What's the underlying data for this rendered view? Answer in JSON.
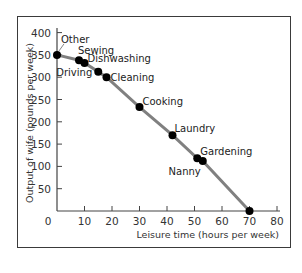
{
  "chart_data": {
    "type": "line",
    "title": "",
    "xlabel": "Leisure time (hours per week)",
    "ylabel": "Output of wife (pounds per week)",
    "xlim": [
      0,
      80
    ],
    "ylim": [
      0,
      400
    ],
    "x_ticks": [
      "0",
      "10",
      "20",
      "30",
      "40",
      "50",
      "60",
      "70",
      "80"
    ],
    "y_ticks": [
      "50",
      "100",
      "150",
      "200",
      "250",
      "300",
      "350",
      "400"
    ],
    "grid": false,
    "legend": null,
    "line_color": "#808080",
    "marker_color": "#000000",
    "series": [
      {
        "name": "Production possibilities",
        "points": [
          {
            "label": "Other",
            "x": 0,
            "y": 350
          },
          {
            "label": "Sewing",
            "x": 8,
            "y": 338
          },
          {
            "label": "Dishwashing",
            "x": 10,
            "y": 332
          },
          {
            "label": "Driving",
            "x": 15,
            "y": 312
          },
          {
            "label": "Cleaning",
            "x": 18,
            "y": 300
          },
          {
            "label": "Cooking",
            "x": 30,
            "y": 233
          },
          {
            "label": "Laundry",
            "x": 42,
            "y": 170
          },
          {
            "label": "Gardening",
            "x": 51,
            "y": 118
          },
          {
            "label": "Nanny",
            "x": 53,
            "y": 112
          },
          {
            "label": "",
            "x": 70,
            "y": 0
          }
        ]
      }
    ]
  }
}
